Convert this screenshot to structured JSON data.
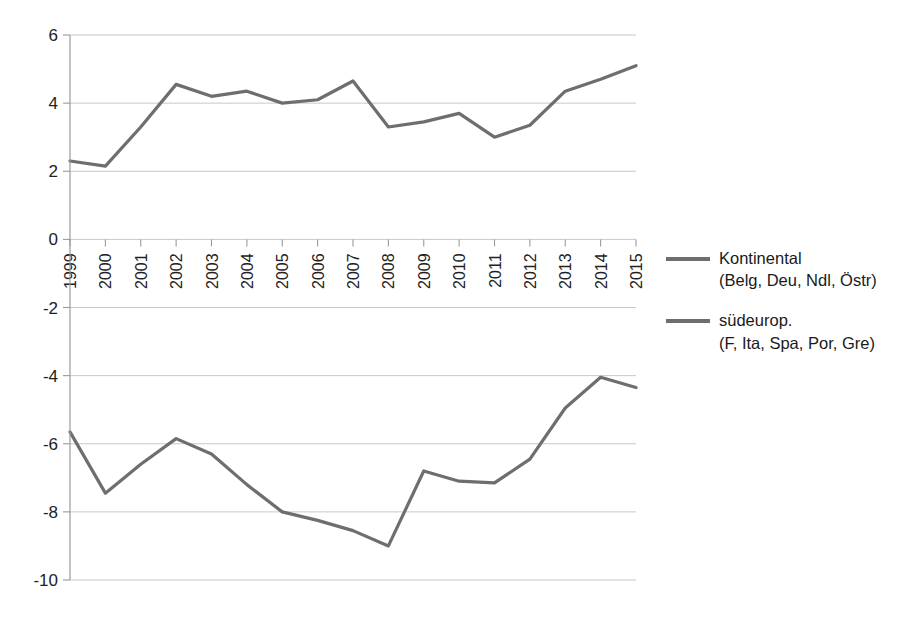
{
  "chart_data": {
    "type": "line",
    "title": "",
    "xlabel": "",
    "ylabel": "",
    "grid": true,
    "legend_position": "right",
    "ylim": [
      -10,
      6
    ],
    "ytick_labels": [
      "6",
      "4",
      "2",
      "0",
      "-2",
      "-4",
      "-6",
      "-8",
      "-10"
    ],
    "ytick_values": [
      6,
      4,
      2,
      0,
      -2,
      -4,
      -6,
      -8,
      -10
    ],
    "categories": [
      "1999",
      "2000",
      "2001",
      "2002",
      "2003",
      "2004",
      "2005",
      "2006",
      "2007",
      "2008",
      "2009",
      "2010",
      "2011",
      "2012",
      "2013",
      "2014",
      "2015"
    ],
    "series": [
      {
        "name": "Kontinental",
        "sub": "(Belg, Deu, Ndl, Östr)",
        "color": "#6e6e6e",
        "values": [
          2.3,
          2.15,
          3.3,
          4.55,
          4.2,
          4.35,
          4.0,
          4.1,
          4.65,
          3.3,
          3.45,
          3.7,
          3.0,
          3.35,
          4.35,
          4.7,
          5.1
        ]
      },
      {
        "name": "südeurop.",
        "sub": "(F, Ita, Spa, Por, Gre)",
        "color": "#6e6e6e",
        "values": [
          -5.65,
          -7.45,
          -6.6,
          -5.85,
          -6.3,
          -7.2,
          -8.0,
          -8.25,
          -8.55,
          -9.0,
          -6.8,
          -7.1,
          -7.15,
          -6.45,
          -4.95,
          -4.05,
          -4.35
        ]
      }
    ],
    "series_extra_note": ""
  },
  "legend": {
    "entries": [
      {
        "label": "Kontinental",
        "sub": "(Belg, Deu, Ndl, Östr)"
      },
      {
        "label": "südeurop.",
        "sub": "(F, Ita, Spa, Por, Gre)"
      }
    ]
  },
  "colors": {
    "line": "#6e6e6e",
    "grid": "#c8c8c8",
    "axis": "#9a9a9a",
    "text": "#1a1a1a",
    "background": "#ffffff"
  }
}
